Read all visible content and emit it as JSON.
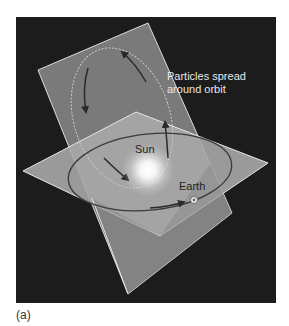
{
  "figure": {
    "caption": "(a)",
    "labels": {
      "particles_line1": "Particles spread",
      "particles_line2": "around orbit",
      "sun": "Sun",
      "earth": "Earth"
    },
    "colors": {
      "background": "#1c1c1c",
      "tilted_plane": "#7a7a7a",
      "ecliptic_plane": "#a8a8a8",
      "plane_edge": "#e0e0e0",
      "orbit_line": "#3a3a3a",
      "label_light": "#e8e8e8",
      "label_dark": "#222222"
    }
  }
}
